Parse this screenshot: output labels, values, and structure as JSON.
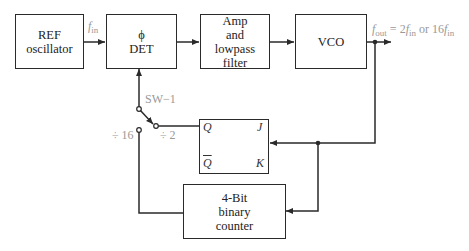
{
  "diagram": {
    "blocks": {
      "ref_osc": {
        "line1": "REF",
        "line2": "oscillator"
      },
      "phase_det": {
        "line1": "ϕ",
        "line2": "DET"
      },
      "amp_filter": {
        "line1": "Amp",
        "line2": "and",
        "line3": "lowpass",
        "line4": "filter"
      },
      "vco": {
        "line1": "VCO"
      },
      "flipflop": {
        "q": "Q",
        "qbar": "Q",
        "j": "J",
        "k": "K"
      },
      "counter": {
        "line1": "4-Bit",
        "line2": "binary",
        "line3": "counter"
      }
    },
    "labels": {
      "fin_f": "f",
      "fin_sub": "in",
      "fout_f": "f",
      "fout_sub": "out",
      "fout_eq": " = 2",
      "fout_f2": "f",
      "fout_sub2": "in",
      "fout_or": " or 16",
      "fout_f3": "f",
      "fout_sub3": "in",
      "switch": "SW−1",
      "div2": "÷ 2",
      "div16": "÷ 16"
    },
    "colors": {
      "line": "#2a2a2a",
      "label_gray": "#999999"
    }
  }
}
